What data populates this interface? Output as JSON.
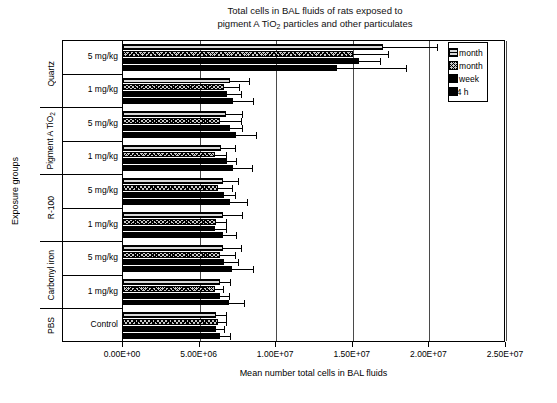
{
  "title": {
    "line1": "Total cells in BAL fluids of rats exposed to",
    "line2_pre": "pigment A TiO",
    "line2_sub": "2",
    "line2_post": " particles and other particulates"
  },
  "axes": {
    "y_title": "Exposure groups",
    "x_title": "Mean number total cells in BAL fluids",
    "x_ticks": [
      "0.00E+00",
      "5.00E+06",
      "1.00E+07",
      "1.50E+07",
      "2.00E+07",
      "2.50E+07"
    ],
    "x_min": 0,
    "x_max": 25000000,
    "x_step": 5000000
  },
  "legend": {
    "items": [
      {
        "label": "3 month",
        "pattern": "horizontal-lines",
        "swatch": "p3month"
      },
      {
        "label": "1 month",
        "pattern": "crosshatch",
        "swatch": "p1month"
      },
      {
        "label": "1 week",
        "pattern": "solid-black",
        "swatch": "p1week"
      },
      {
        "label": "24 h",
        "pattern": "solid-black",
        "swatch": "p24h"
      }
    ]
  },
  "groups": [
    {
      "name": "Quartz",
      "rows": [
        "5 mg/kg",
        "1 mg/kg"
      ]
    },
    {
      "name_pre": "Pigment A TiO",
      "name_sub": "2",
      "name": "Pigment A TiO2",
      "rows": [
        "5 mg/kg",
        "1 mg/kg"
      ]
    },
    {
      "name": "R-100",
      "rows": [
        "5 mg/kg",
        "1 mg/kg"
      ]
    },
    {
      "name": "Carbonyl iron",
      "rows": [
        "5 mg/kg",
        "1 mg/kg"
      ]
    },
    {
      "name": "PBS",
      "rows": [
        "Control"
      ]
    }
  ],
  "chart_data": {
    "type": "bar",
    "orientation": "horizontal",
    "title": "Total cells in BAL fluids of rats exposed to pigment A TiO2 particles and other particulates",
    "xlabel": "Mean number total cells in BAL fluids",
    "ylabel": "Exposure groups",
    "xlim": [
      0,
      25000000
    ],
    "xticks": [
      0,
      5000000,
      10000000,
      15000000,
      20000000,
      25000000
    ],
    "grid": true,
    "legend_position": "top-right",
    "categories": [
      "Quartz 5 mg/kg",
      "Quartz 1 mg/kg",
      "Pigment A TiO2 5 mg/kg",
      "Pigment A TiO2 1 mg/kg",
      "R-100 5 mg/kg",
      "R-100 1 mg/kg",
      "Carbonyl iron 5 mg/kg",
      "Carbonyl iron 1 mg/kg",
      "PBS Control"
    ],
    "series": [
      {
        "name": "3 month",
        "values": [
          17000000,
          7000000,
          6700000,
          6400000,
          6500000,
          6500000,
          6500000,
          6300000,
          6100000
        ],
        "errors": [
          3500000,
          1200000,
          1100000,
          900000,
          1000000,
          1300000,
          1200000,
          700000,
          600000
        ]
      },
      {
        "name": "1 month",
        "values": [
          15000000,
          6600000,
          6300000,
          6000000,
          6200000,
          6100000,
          6300000,
          6000000,
          6200000
        ],
        "errors": [
          2300000,
          1000000,
          1400000,
          700000,
          900000,
          600000,
          1000000,
          500000,
          500000
        ]
      },
      {
        "name": "1 week",
        "values": [
          15400000,
          6800000,
          7000000,
          6800000,
          6600000,
          6000000,
          6600000,
          6300000,
          6100000
        ],
        "errors": [
          1400000,
          900000,
          800000,
          600000,
          700000,
          700000,
          900000,
          600000,
          500000
        ]
      },
      {
        "name": "24 h",
        "values": [
          14000000,
          7200000,
          7400000,
          7200000,
          7000000,
          6500000,
          7100000,
          6900000,
          6300000
        ],
        "errors": [
          4500000,
          1300000,
          1300000,
          1200000,
          1100000,
          900000,
          1400000,
          1000000,
          700000
        ]
      }
    ]
  }
}
